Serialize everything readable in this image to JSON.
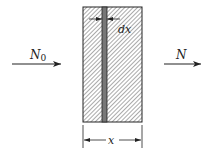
{
  "labels": {
    "left_force": "N",
    "left_force_sub": "0",
    "right_force": "N",
    "strip_width": "dx",
    "dimension": "x"
  },
  "colors": {
    "ink": "#222222",
    "hatch": "#444444",
    "strip": "#777777"
  }
}
